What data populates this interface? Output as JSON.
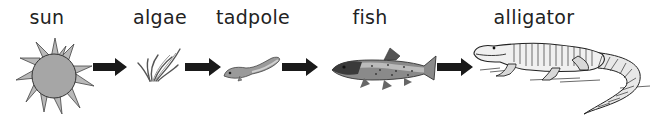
{
  "organisms": [
    {
      "name": "sun",
      "icon": "sun-icon"
    },
    {
      "name": "algae",
      "icon": "algae-icon"
    },
    {
      "name": "tadpole",
      "icon": "tadpole-icon"
    },
    {
      "name": "fish",
      "icon": "fish-icon"
    },
    {
      "name": "alligator",
      "icon": "alligator-icon"
    }
  ],
  "arrows": [
    {
      "from": "sun",
      "to": "algae"
    },
    {
      "from": "algae",
      "to": "tadpole"
    },
    {
      "from": "tadpole",
      "to": "fish"
    },
    {
      "from": "fish",
      "to": "alligator"
    }
  ],
  "colors": {
    "arrow": "#1a1a1a",
    "sun": "#a6a6a6",
    "text": "#222222"
  }
}
